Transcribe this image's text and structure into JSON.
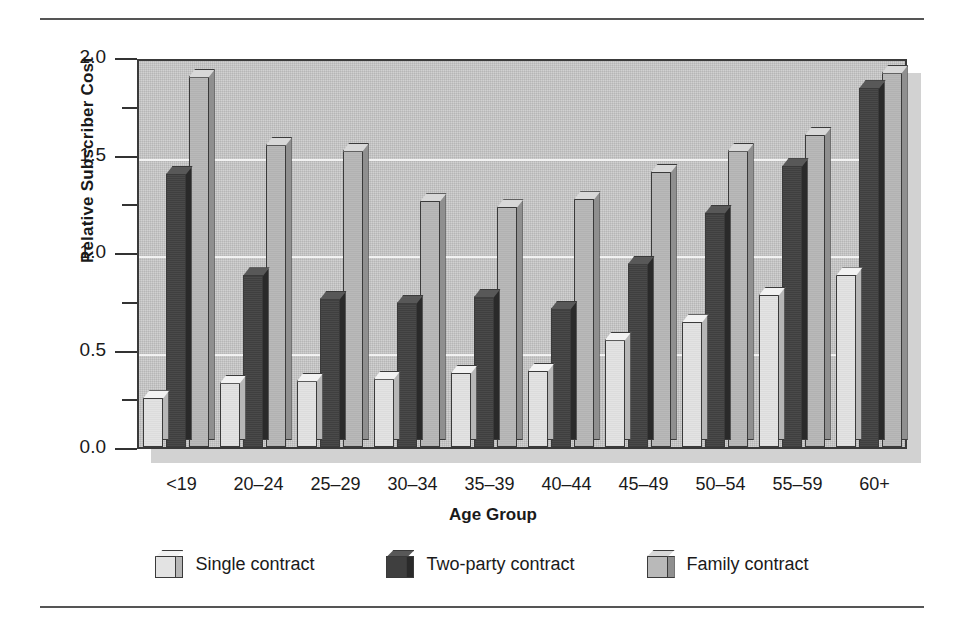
{
  "figure": {
    "rules": [
      "top-rule",
      "bottom-rule"
    ]
  },
  "chart_data": {
    "type": "bar",
    "title": "",
    "xlabel": "Age Group",
    "ylabel": "Relative Subscriber Cost",
    "ylim": [
      0.0,
      2.0
    ],
    "ytick_labels": [
      "0.0",
      "0.5",
      "1.0",
      "1.5",
      "2.0"
    ],
    "ytick_values": [
      0.0,
      0.5,
      1.0,
      1.5,
      2.0
    ],
    "yminor_values": [
      0.25,
      0.75,
      1.25,
      1.75
    ],
    "grid": "horizontal-major-white",
    "legend_position": "bottom-center",
    "style": "3d-grouped-bars",
    "categories": [
      "<19",
      "20–24",
      "25–29",
      "30–34",
      "35–39",
      "40–44",
      "45–49",
      "50–54",
      "55–59",
      "60+"
    ],
    "series": [
      {
        "name": "Single contract",
        "color": "#e3e3e3",
        "values": [
          0.25,
          0.33,
          0.34,
          0.35,
          0.38,
          0.39,
          0.55,
          0.64,
          0.78,
          0.88
        ]
      },
      {
        "name": "Two-party contract",
        "color": "#3f3f3f",
        "values": [
          1.4,
          0.88,
          0.76,
          0.74,
          0.77,
          0.71,
          0.94,
          1.2,
          1.44,
          1.84
        ]
      },
      {
        "name": "Family contract",
        "color": "#b9b9b9",
        "values": [
          1.9,
          1.55,
          1.52,
          1.26,
          1.23,
          1.27,
          1.41,
          1.52,
          1.6,
          1.92
        ]
      }
    ],
    "plot_background": "#c6c6c6",
    "gridline_color": "#f2f2f2",
    "axis_color": "#3a3a3a"
  }
}
